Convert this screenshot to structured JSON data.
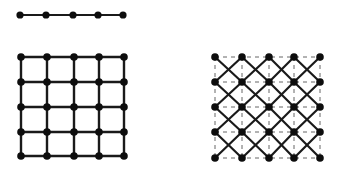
{
  "colors": {
    "background": "#ffffff",
    "edge": "#1a1a1a",
    "node": "#0d0d0d",
    "dashed": "#555555"
  },
  "chain": {
    "y": 15,
    "xs": [
      20,
      46,
      73,
      98,
      123
    ],
    "node_radius": 3.6,
    "edge_width": 2.2
  },
  "square_lattice": {
    "xs": [
      21,
      47,
      74,
      99,
      124
    ],
    "ys": [
      57,
      82,
      107,
      132,
      156
    ],
    "node_radius": 3.8,
    "edge_width": 2.4
  },
  "diagonal_lattice": {
    "xs": [
      215,
      242,
      269,
      294,
      320
    ],
    "ys": [
      57,
      82,
      107,
      132,
      158
    ],
    "node_radius": 3.8,
    "edge_width": 2.2,
    "dashed_width": 0.9,
    "dash_pattern": "4,4"
  }
}
